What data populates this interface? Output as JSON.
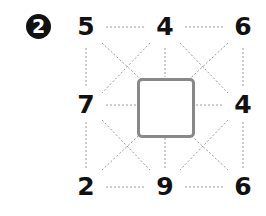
{
  "puzzle": {
    "badge_number": "2",
    "grid": {
      "top_left": "5",
      "top_middle": "4",
      "top_right": "6",
      "middle_left": "7",
      "middle_right": "4",
      "bottom_left": "2",
      "bottom_middle": "9",
      "bottom_right": "6"
    },
    "center_answer": "",
    "colors": {
      "number_color": "#111111",
      "dashed_line_color": "#999999",
      "answer_box_border": "#888888",
      "badge_background": "#111111"
    }
  }
}
